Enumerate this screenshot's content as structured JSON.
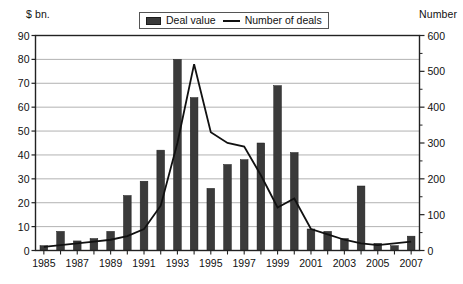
{
  "axis_unit_left": "$ bn.",
  "axis_unit_right": "Number",
  "legend": {
    "items": [
      {
        "label": "Deal value",
        "marker": "bar-swatch",
        "color": "#3a3a3a"
      },
      {
        "label": "Number of deals",
        "marker": "line-swatch",
        "color": "#111111"
      }
    ]
  },
  "chart_data": {
    "type": "bar",
    "title": "",
    "subtitle": "",
    "xlabel": "",
    "ylabel": "$ bn.",
    "y2label": "Number",
    "grid": true,
    "legend_position": "top-center",
    "categories": [
      "1985",
      "1986",
      "1987",
      "1988",
      "1989",
      "1990",
      "1991",
      "1992",
      "1993",
      "1994",
      "1995",
      "1996",
      "1997",
      "1998",
      "1999",
      "2000",
      "2001",
      "2002",
      "2003",
      "2004",
      "2005",
      "2006",
      "2007"
    ],
    "xtick_labels": [
      "1985",
      "1987",
      "1989",
      "1991",
      "1993",
      "1995",
      "1997",
      "1999",
      "2001",
      "2003",
      "2005",
      "2007"
    ],
    "ylim": [
      0,
      90
    ],
    "yticks": [
      0,
      10,
      20,
      30,
      40,
      50,
      60,
      70,
      80,
      90
    ],
    "y2lim": [
      0,
      600
    ],
    "y2ticks": [
      0,
      100,
      200,
      300,
      400,
      500,
      600
    ],
    "y2minorticks": [
      50,
      150,
      250,
      350,
      450,
      550
    ],
    "series": [
      {
        "name": "Deal value",
        "type": "bar",
        "axis": "left",
        "unit": "$ bn.",
        "color": "#3a3a3a",
        "values": [
          2,
          8,
          4,
          5,
          8,
          23,
          29,
          42,
          80,
          64,
          26,
          36,
          38,
          45,
          69,
          41,
          9,
          8,
          5,
          27,
          3,
          2,
          6
        ]
      },
      {
        "name": "Number of deals",
        "type": "line",
        "axis": "right",
        "unit": "Number",
        "color": "#111111",
        "values": [
          10,
          15,
          20,
          25,
          30,
          40,
          60,
          125,
          300,
          520,
          330,
          300,
          290,
          210,
          120,
          145,
          60,
          45,
          30,
          20,
          15,
          20,
          25
        ]
      }
    ]
  }
}
